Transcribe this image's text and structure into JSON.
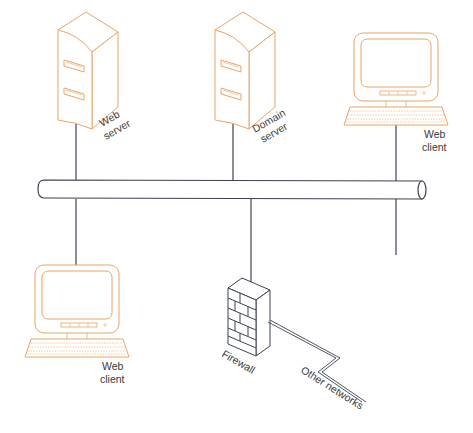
{
  "diagram": {
    "type": "network-bus-topology",
    "colors": {
      "device_outline": "#e8a66a",
      "line": "#3d4252",
      "label": "#3a3a3a",
      "background": "#ffffff"
    },
    "bus": {
      "label": ""
    },
    "nodes": [
      {
        "id": "web-server",
        "kind": "server",
        "label_line1": "Web",
        "label_line2": "server"
      },
      {
        "id": "domain-server",
        "kind": "server",
        "label_line1": "Domain",
        "label_line2": "server"
      },
      {
        "id": "web-client-top-right",
        "kind": "client",
        "label_line1": "Web",
        "label_line2": "client"
      },
      {
        "id": "web-client-bottom-left",
        "kind": "client",
        "label_line1": "Web",
        "label_line2": "client"
      },
      {
        "id": "firewall",
        "kind": "firewall",
        "label_line1": "Firewall"
      },
      {
        "id": "web-client-bottom-right",
        "kind": "client",
        "label_line1": "Web",
        "label_line2": "client"
      }
    ],
    "external": {
      "label": "Other networks",
      "icon": "lightning-link-icon"
    }
  }
}
